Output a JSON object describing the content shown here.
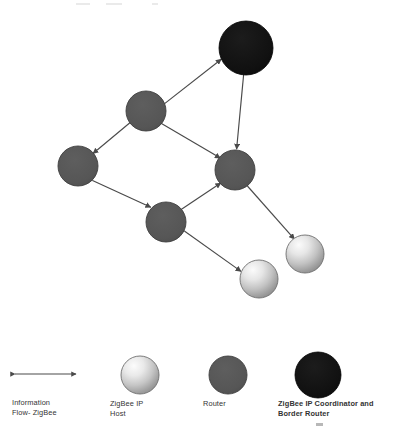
{
  "diagram": {
    "type": "network-graph",
    "canvas": {
      "width": 402,
      "height": 440
    },
    "colors": {
      "background": "#ffffff",
      "router_fill": "#565656",
      "router_stroke": "#3f3f3f",
      "coordinator_fill": "#121212",
      "coordinator_stroke": "#000000",
      "host_gradient_light": "#f2f2f2",
      "host_gradient_mid": "#c9c9c9",
      "host_gradient_dark": "#8f8f8f",
      "host_stroke": "#6e6e6e",
      "edge": "#4a4a4a",
      "text": "#333333"
    },
    "nodes": [
      {
        "id": "coordinator",
        "kind": "coordinator",
        "label": "",
        "cx": 246,
        "cy": 48,
        "r": 27
      },
      {
        "id": "router-top-left",
        "kind": "router",
        "label": "",
        "cx": 146,
        "cy": 111,
        "r": 20
      },
      {
        "id": "router-left",
        "kind": "router",
        "label": "",
        "cx": 78,
        "cy": 166,
        "r": 20
      },
      {
        "id": "router-center-right",
        "kind": "router",
        "label": "",
        "cx": 235,
        "cy": 170,
        "r": 20
      },
      {
        "id": "router-bottom",
        "kind": "router",
        "label": "",
        "cx": 166,
        "cy": 222,
        "r": 20
      },
      {
        "id": "host-lower-left",
        "kind": "host",
        "label": "",
        "cx": 259,
        "cy": 279,
        "r": 19
      },
      {
        "id": "host-upper-right",
        "kind": "host",
        "label": "",
        "cx": 305,
        "cy": 254,
        "r": 19
      }
    ],
    "edges": [
      {
        "from": "router-top-left",
        "to": "coordinator",
        "direction": "bidirectional"
      },
      {
        "from": "coordinator",
        "to": "router-center-right",
        "direction": "bidirectional"
      },
      {
        "from": "router-top-left",
        "to": "router-left",
        "direction": "bidirectional"
      },
      {
        "from": "router-top-left",
        "to": "router-center-right",
        "direction": "bidirectional"
      },
      {
        "from": "router-left",
        "to": "router-bottom",
        "direction": "bidirectional"
      },
      {
        "from": "router-bottom",
        "to": "router-center-right",
        "direction": "bidirectional"
      },
      {
        "from": "router-center-right",
        "to": "host-upper-right",
        "direction": "bidirectional"
      },
      {
        "from": "router-bottom",
        "to": "host-lower-left",
        "direction": "bidirectional"
      }
    ]
  },
  "legend": {
    "items": [
      {
        "id": "flow",
        "symbol": "double-arrow",
        "label": "Information\nFlow- ZigBee"
      },
      {
        "id": "host",
        "symbol": "gradient-circle",
        "label": "ZigBee IP\nHost"
      },
      {
        "id": "router",
        "symbol": "gray-circle",
        "label": "Router"
      },
      {
        "id": "coordinator",
        "symbol": "black-circle",
        "label": "ZigBee IP Coordinator and\nBorder Router"
      }
    ],
    "arrow": {
      "x1": 13,
      "x2": 78,
      "y": 374
    },
    "swatches": [
      {
        "id": "host",
        "cx": 140,
        "cy": 375,
        "r": 19
      },
      {
        "id": "router",
        "cx": 228,
        "cy": 375,
        "r": 19
      },
      {
        "id": "coordinator",
        "cx": 318,
        "cy": 375,
        "r": 23
      }
    ]
  }
}
